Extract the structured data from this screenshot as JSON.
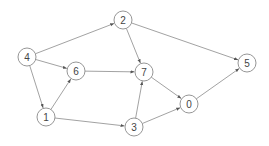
{
  "graph": {
    "directed": true,
    "node_radius": 9,
    "nodes": [
      {
        "id": "0",
        "label": "0",
        "x": 189,
        "y": 104
      },
      {
        "id": "1",
        "label": "1",
        "x": 46,
        "y": 117
      },
      {
        "id": "2",
        "label": "2",
        "x": 123,
        "y": 20
      },
      {
        "id": "3",
        "label": "3",
        "x": 134,
        "y": 127
      },
      {
        "id": "4",
        "label": "4",
        "x": 27,
        "y": 57
      },
      {
        "id": "5",
        "label": "5",
        "x": 247,
        "y": 63
      },
      {
        "id": "6",
        "label": "6",
        "x": 76,
        "y": 71
      },
      {
        "id": "7",
        "label": "7",
        "x": 144,
        "y": 72
      }
    ],
    "edges": [
      {
        "from": "4",
        "to": "2"
      },
      {
        "from": "4",
        "to": "6"
      },
      {
        "from": "4",
        "to": "1"
      },
      {
        "from": "1",
        "to": "6"
      },
      {
        "from": "1",
        "to": "3"
      },
      {
        "from": "6",
        "to": "7"
      },
      {
        "from": "2",
        "to": "7"
      },
      {
        "from": "2",
        "to": "5"
      },
      {
        "from": "7",
        "to": "0"
      },
      {
        "from": "3",
        "to": "7"
      },
      {
        "from": "3",
        "to": "0"
      },
      {
        "from": "0",
        "to": "5"
      }
    ],
    "colors": {
      "stroke": "#8a8a8a",
      "text": "#444444",
      "fill": "#ffffff"
    }
  }
}
